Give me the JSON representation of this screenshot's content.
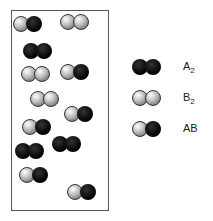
{
  "molecules": [
    {
      "type": "AB",
      "x": 21,
      "y": 24
    },
    {
      "type": "B2",
      "x": 68,
      "y": 22
    },
    {
      "type": "A2",
      "x": 31,
      "y": 51
    },
    {
      "type": "B2",
      "x": 29,
      "y": 74
    },
    {
      "type": "AB",
      "x": 68,
      "y": 72
    },
    {
      "type": "B2",
      "x": 38,
      "y": 99
    },
    {
      "type": "AB",
      "x": 72,
      "y": 114
    },
    {
      "type": "AB",
      "x": 30,
      "y": 127
    },
    {
      "type": "A2",
      "x": 60,
      "y": 144
    },
    {
      "type": "A2",
      "x": 23,
      "y": 151
    },
    {
      "type": "AB",
      "x": 27,
      "y": 175
    },
    {
      "type": "AB",
      "x": 75,
      "y": 192
    }
  ],
  "legend": [
    {
      "type": "A2",
      "label": "A",
      "sub": "2",
      "y": 67
    },
    {
      "type": "B2",
      "label": "B",
      "sub": "2",
      "y": 98
    },
    {
      "type": "AB",
      "label": "AB",
      "sub": "",
      "y": 129
    }
  ]
}
